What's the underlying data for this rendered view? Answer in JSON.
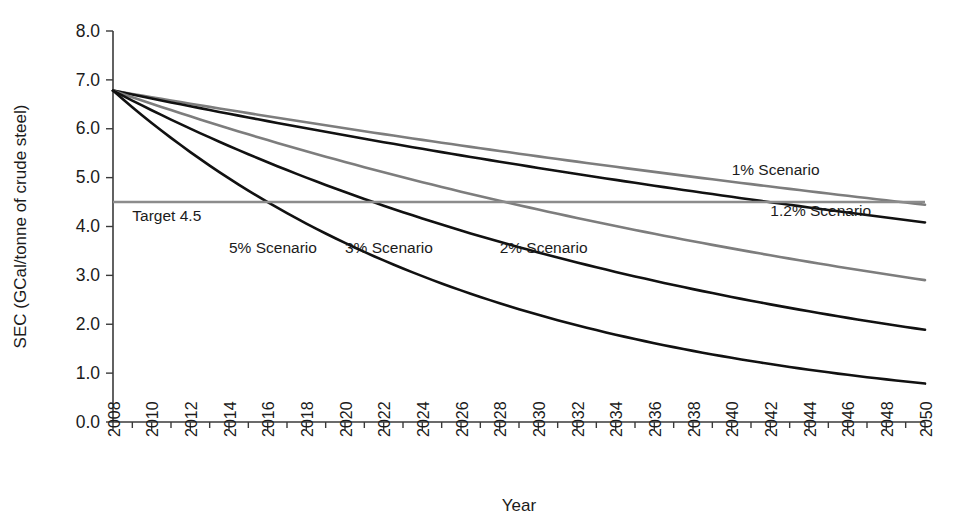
{
  "chart_data": {
    "type": "line",
    "title": "",
    "xlabel": "Year",
    "ylabel": "SEC (GCal/tonne of crude steel)",
    "xlim": [
      2008,
      2050
    ],
    "ylim": [
      0.0,
      8.0
    ],
    "grid": false,
    "legend_position": "inline-annotations",
    "x_tick_labels": [
      "2008",
      "2010",
      "2012",
      "2014",
      "2016",
      "2018",
      "2020",
      "2022",
      "2024",
      "2026",
      "2028",
      "2030",
      "2032",
      "2034",
      "2036",
      "2038",
      "2040",
      "2042",
      "2044",
      "2046",
      "2048",
      "2050"
    ],
    "x_tick_step": 2,
    "x_minor_tick_step": 1,
    "y_tick_labels": [
      "0.0",
      "1.0",
      "2.0",
      "3.0",
      "4.0",
      "5.0",
      "6.0",
      "7.0",
      "8.0"
    ],
    "y_tick_values": [
      0.0,
      1.0,
      2.0,
      3.0,
      4.0,
      5.0,
      6.0,
      7.0,
      8.0
    ],
    "start_value": 6.78,
    "start_year": 2008,
    "series": [
      {
        "name": "1% Scenario",
        "rate_percent": 1.0,
        "color": "#7d7d7d",
        "label_x": 2040,
        "label_y": 5.05,
        "end_value": 4.5,
        "x": [
          2008,
          2010,
          2012,
          2014,
          2016,
          2018,
          2020,
          2022,
          2024,
          2026,
          2028,
          2030,
          2032,
          2034,
          2036,
          2038,
          2040,
          2042,
          2044,
          2046,
          2048,
          2050
        ],
        "values": [
          6.78,
          6.64,
          6.51,
          6.38,
          6.25,
          6.13,
          6.01,
          5.89,
          5.77,
          5.65,
          5.54,
          5.43,
          5.32,
          5.21,
          5.11,
          5.0,
          4.9,
          4.81,
          4.71,
          4.62,
          4.53,
          4.44
        ]
      },
      {
        "name": "1.2% Scenario",
        "rate_percent": 1.2,
        "color": "#111111",
        "label_x": 2042,
        "label_y": 4.22,
        "end_value": 4.05,
        "x": [
          2008,
          2010,
          2012,
          2014,
          2016,
          2018,
          2020,
          2022,
          2024,
          2026,
          2028,
          2030,
          2032,
          2034,
          2036,
          2038,
          2040,
          2042,
          2044,
          2046,
          2048,
          2050
        ],
        "values": [
          6.78,
          6.62,
          6.46,
          6.31,
          6.16,
          6.01,
          5.87,
          5.73,
          5.59,
          5.46,
          5.33,
          5.2,
          5.08,
          4.96,
          4.84,
          4.73,
          4.61,
          4.5,
          4.4,
          4.29,
          4.19,
          4.09
        ]
      },
      {
        "name": "2% Scenario",
        "rate_percent": 2.0,
        "color": "#7d7d7d",
        "label_x": 2028,
        "label_y": 3.45,
        "end_value": 2.85,
        "x": [
          2008,
          2010,
          2012,
          2014,
          2016,
          2018,
          2020,
          2022,
          2024,
          2026,
          2028,
          2030,
          2032,
          2034,
          2036,
          2038,
          2040,
          2042,
          2044,
          2046,
          2048,
          2050
        ],
        "values": [
          6.78,
          6.51,
          6.25,
          6.0,
          5.77,
          5.54,
          5.32,
          5.11,
          4.9,
          4.71,
          4.52,
          4.34,
          4.17,
          4.01,
          3.85,
          3.69,
          3.55,
          3.41,
          3.27,
          3.14,
          3.02,
          2.9
        ]
      },
      {
        "name": "3% Scenario",
        "rate_percent": 3.0,
        "color": "#111111",
        "label_x": 2020,
        "label_y": 3.45,
        "end_value": 1.85,
        "x": [
          2008,
          2010,
          2012,
          2014,
          2016,
          2018,
          2020,
          2022,
          2024,
          2026,
          2028,
          2030,
          2032,
          2034,
          2036,
          2038,
          2040,
          2042,
          2044,
          2046,
          2048,
          2050
        ],
        "values": [
          6.78,
          6.38,
          6.0,
          5.65,
          5.32,
          5.0,
          4.71,
          4.43,
          4.17,
          3.93,
          3.7,
          3.48,
          3.27,
          3.08,
          2.9,
          2.73,
          2.57,
          2.42,
          2.28,
          2.14,
          2.02,
          1.9
        ]
      },
      {
        "name": "5% Scenario",
        "rate_percent": 5.0,
        "color": "#111111",
        "label_x": 2014,
        "label_y": 3.45,
        "end_value": 0.78,
        "x": [
          2008,
          2010,
          2012,
          2014,
          2016,
          2018,
          2020,
          2022,
          2024,
          2026,
          2028,
          2030,
          2032,
          2034,
          2036,
          2038,
          2040,
          2042,
          2044,
          2046,
          2048,
          2050
        ],
        "values": [
          6.78,
          6.12,
          5.52,
          4.98,
          4.5,
          4.06,
          3.66,
          3.3,
          2.98,
          2.69,
          2.43,
          2.19,
          1.98,
          1.79,
          1.61,
          1.46,
          1.31,
          1.19,
          1.07,
          0.97,
          0.87,
          0.79
        ]
      }
    ],
    "reference_line": {
      "name": "Target 4.5",
      "label": "Target 4.5",
      "value": 4.5,
      "color": "#8c8c8c",
      "label_x": 2009,
      "label_y": 4.12
    }
  }
}
